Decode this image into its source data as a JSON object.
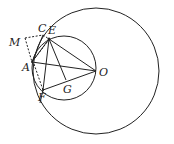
{
  "diagram": {
    "type": "geometry",
    "stroke_color": "#222222",
    "circles": [
      {
        "name": "large-circle",
        "center": "O",
        "cx": 96,
        "cy": 71,
        "r": 63
      },
      {
        "name": "small-circle",
        "cx": 64,
        "cy": 68,
        "r": 32
      }
    ],
    "points": {
      "O": {
        "x": 96,
        "y": 71,
        "label": "O"
      },
      "C": {
        "x": 43,
        "y": 35,
        "label": "C"
      },
      "E": {
        "x": 49,
        "y": 39,
        "label": "E"
      },
      "M": {
        "x": 25,
        "y": 38,
        "label": "M"
      },
      "A": {
        "x": 32,
        "y": 62,
        "label": "A"
      },
      "F": {
        "x": 43,
        "y": 90,
        "label": "F"
      },
      "G": {
        "x": 66,
        "y": 80,
        "label": "G"
      }
    },
    "solid_segments": [
      [
        "A",
        "O"
      ],
      [
        "E",
        "O"
      ],
      [
        "F",
        "O"
      ],
      [
        "E",
        "F"
      ],
      [
        "E",
        "G"
      ],
      [
        "A",
        "E"
      ],
      [
        "A",
        "C"
      ],
      [
        "C",
        "F"
      ]
    ],
    "dashed_segments": [
      [
        "M",
        "C"
      ],
      [
        "M",
        "A"
      ],
      [
        "A",
        "E"
      ],
      [
        "E",
        "F"
      ]
    ]
  }
}
